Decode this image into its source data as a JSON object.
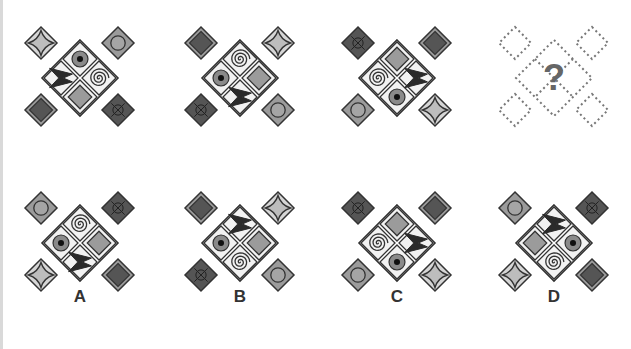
{
  "puzzle": {
    "colors": {
      "outline": "#333333",
      "light_fill": "#d6d6d6",
      "mid_fill": "#9b9b9b",
      "dark_fill": "#555555",
      "cell_bg": "#f2f2f2",
      "qmark": "#666666"
    },
    "question_panels": [
      {
        "name": "panel-1",
        "corners": {
          "tl": "star",
          "tr": "circle",
          "bl": "dark-square",
          "br": "dark-cross"
        },
        "center": {
          "top": "dot-circle",
          "left": "bowtie",
          "right": "spiral",
          "bottom": "gray-square"
        }
      },
      {
        "name": "panel-2",
        "corners": {
          "tl": "dark-square",
          "tr": "star",
          "bl": "dark-cross",
          "br": "circle"
        },
        "center": {
          "top": "spiral",
          "left": "dot-circle",
          "right": "gray-square",
          "bottom": "bowtie"
        }
      },
      {
        "name": "panel-3",
        "corners": {
          "tl": "dark-cross",
          "tr": "dark-square",
          "bl": "circle",
          "br": "star"
        },
        "center": {
          "top": "gray-square",
          "left": "spiral",
          "right": "bowtie",
          "bottom": "dot-circle"
        }
      },
      {
        "name": "panel-4-unknown",
        "unknown": true,
        "question_mark": "?"
      }
    ],
    "options": [
      {
        "label": "A",
        "corners": {
          "tl": "circle",
          "tr": "dark-cross",
          "bl": "star",
          "br": "dark-square"
        },
        "center": {
          "top": "spiral",
          "left": "dot-circle",
          "right": "gray-square",
          "bottom": "bowtie"
        }
      },
      {
        "label": "B",
        "corners": {
          "tl": "dark-square",
          "tr": "star",
          "bl": "dark-cross",
          "br": "circle"
        },
        "center": {
          "top": "bowtie",
          "left": "dot-circle",
          "right": "gray-square",
          "bottom": "spiral"
        }
      },
      {
        "label": "C",
        "corners": {
          "tl": "dark-cross",
          "tr": "dark-square",
          "bl": "circle",
          "br": "star"
        },
        "center": {
          "top": "gray-square",
          "left": "spiral",
          "right": "bowtie",
          "bottom": "dot-circle"
        }
      },
      {
        "label": "D",
        "corners": {
          "tl": "circle",
          "tr": "dark-cross",
          "bl": "star",
          "br": "dark-square"
        },
        "center": {
          "top": "bowtie",
          "left": "gray-square",
          "right": "dot-circle",
          "bottom": "spiral"
        }
      }
    ]
  }
}
